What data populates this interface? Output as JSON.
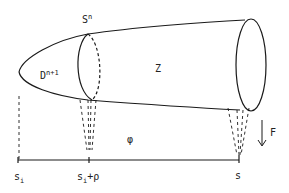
{
  "figure": {
    "stroke_color": "#1a1a1a",
    "background": "#ffffff",
    "labels": {
      "sphere": {
        "base": "S",
        "sup": "n"
      },
      "disk": {
        "base": "D",
        "sup": "n+1"
      },
      "region": "Z",
      "function": "φ",
      "flow": "F",
      "left_point": {
        "base": "s",
        "sub": "i"
      },
      "middle_point": {
        "base": "s",
        "sub": "i",
        "suffix": "+ρ"
      },
      "right_point": "s"
    },
    "components": [
      "tube-shaped body with rounded left cap",
      "middle cross-section ellipse (front solid, back dashed)",
      "right end ellipse (solid)",
      "dashed projection lines from left tip to s_i",
      "dashed cone projection from middle ellipse to s_i+ρ",
      "dashed cone projection from right ellipse to s",
      "horizontal parameter axis from s_i to s",
      "downward arrow labeled F"
    ]
  }
}
